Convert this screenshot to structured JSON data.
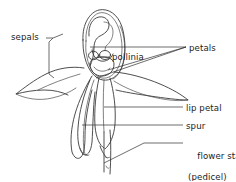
{
  "diagram": {
    "background_color": "#ffffff",
    "ink_color": "#3a3a3a",
    "text_color": "#1c1c1c",
    "width": 236,
    "height": 181,
    "labels": [
      {
        "id": "sepals",
        "text": "sepals",
        "x": 11,
        "y": 32
      },
      {
        "id": "pollinia",
        "text": "pollinia",
        "x": 112,
        "y": 52
      },
      {
        "id": "petals",
        "text": "petals",
        "x": 189,
        "y": 43
      },
      {
        "id": "lip_petal",
        "text": "lip petal",
        "x": 186,
        "y": 103
      },
      {
        "id": "spur",
        "text": "spur",
        "x": 186,
        "y": 121
      },
      {
        "id": "flower_stalk",
        "text": "flower stalk",
        "x": 186,
        "y": 140
      },
      {
        "id": "pedicel",
        "text": "(pedicel)",
        "x": 188,
        "y": 151
      }
    ]
  }
}
